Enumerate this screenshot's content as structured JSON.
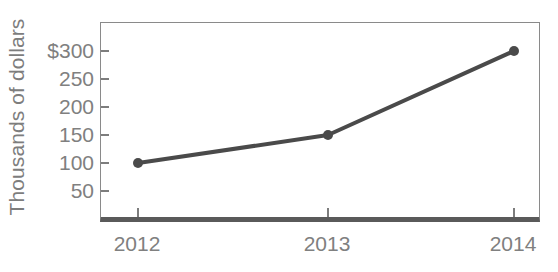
{
  "chart_data": {
    "type": "line",
    "title": "",
    "subtitle": "",
    "xlabel": "",
    "ylabel": "Thousands of dollars",
    "categories": [
      "2012",
      "2013",
      "2014"
    ],
    "x": [
      2012,
      2013,
      2014
    ],
    "values": [
      100,
      150,
      300
    ],
    "series": [
      {
        "name": "",
        "values": [
          100,
          150,
          300
        ]
      }
    ],
    "ylim": [
      0,
      300
    ],
    "y_ticks": [
      50,
      100,
      150,
      200,
      250,
      300
    ],
    "y_tick_labels": [
      "50",
      "100",
      "150",
      "200",
      "250",
      "$300"
    ],
    "x_tick_labels": [
      "2012",
      "2013",
      "2014"
    ],
    "grid": false,
    "legend": false,
    "legend_position": "none",
    "annotations": [],
    "colors": {
      "line": "#4a4a4a",
      "marker": "#4a4a4a",
      "text": "#808080",
      "axis": "#8a8a8a",
      "baseline": "#5a5a5a",
      "background": "#ffffff"
    },
    "marker_style": "circle",
    "line_width": 4,
    "marker_radius": 5
  }
}
